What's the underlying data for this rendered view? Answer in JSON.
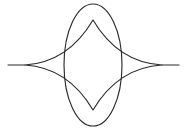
{
  "figure": {
    "canvas": {
      "width": 187,
      "height": 131,
      "background_color": "#ffffff"
    },
    "style": {
      "stroke_color": "#2b2b2b",
      "stroke_width": 1.15,
      "fill": "none"
    },
    "shapes": [
      {
        "name": "ellipse",
        "type": "ellipse",
        "center_x": 93,
        "center_y": 65,
        "radius_x": 29,
        "radius_y": 61,
        "bounds": {
          "left": 64,
          "right": 122,
          "top": 4,
          "bottom": 126
        }
      },
      {
        "name": "astroid",
        "type": "four-cusped-star",
        "center_x": 93,
        "center_y": 65,
        "cusps": [
          {
            "label": "left-cusp",
            "x": 25,
            "y": 65
          },
          {
            "label": "top-cusp",
            "x": 93,
            "y": 20
          },
          {
            "label": "right-cusp",
            "x": 162,
            "y": 65
          },
          {
            "label": "bottom-cusp",
            "x": 93,
            "y": 110
          }
        ],
        "arc_curvature": "concave",
        "semi_width": 68,
        "semi_height": 45
      },
      {
        "name": "left-tail",
        "type": "line",
        "x1": 8,
        "y1": 65,
        "x2": 25,
        "y2": 65
      },
      {
        "name": "right-tail",
        "type": "line",
        "x1": 162,
        "y1": 65,
        "x2": 179,
        "y2": 65
      }
    ],
    "paths": {
      "ellipse_d": "M 93,4 C 109.0,4 122,31.3 122,65 C 122,98.7 109.0,126 93,126 C 77.0,126 64,98.7 64,65 C 64,31.3 77.0,4 93,4 Z",
      "astroid_d": "M 25,65 C 54.5,63.2 77.0,47.0 93,20 C 109.0,47.0 131.5,63.2 162,65 C 131.5,66.8 109.0,83.0 93,110 C 77.0,83.0 54.5,66.8 25,65 Z",
      "left_tail_d": "M 8,65 L 25,65",
      "right_tail_d": "M 162,65 L 179,65"
    }
  }
}
